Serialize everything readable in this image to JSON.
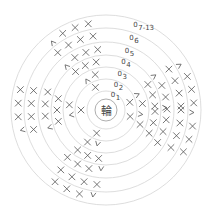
{
  "diagram": {
    "type": "crochet-round-chart",
    "center_label": "輪",
    "rounds": [
      {
        "label": "1",
        "number": 1
      },
      {
        "label": "2",
        "number": 2
      },
      {
        "label": "3",
        "number": 3
      },
      {
        "label": "4",
        "number": 4
      },
      {
        "label": "5",
        "number": 5
      },
      {
        "label": "6",
        "number": 6
      },
      {
        "label": "7-13",
        "number": 7
      }
    ],
    "symbols": {
      "single_crochet": "×",
      "increase": "V",
      "chain_start": "0"
    },
    "colors": {
      "ring": "#d4d4d4",
      "symbol": "#555555",
      "text": "#444444"
    }
  }
}
